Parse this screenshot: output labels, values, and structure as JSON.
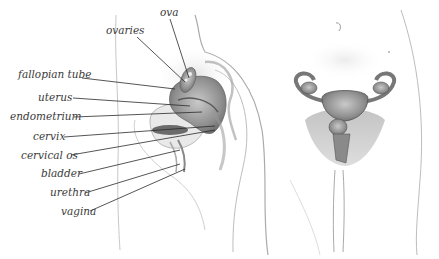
{
  "diagram": {
    "views": [
      "side-section",
      "front"
    ],
    "labels": [
      {
        "id": "ova",
        "text": "ova",
        "x": 160,
        "y": 7,
        "line": [
          [
            170,
            19
          ],
          [
            189,
            78
          ]
        ]
      },
      {
        "id": "ovaries",
        "text": "ovaries",
        "x": 106,
        "y": 25,
        "line": [
          [
            137,
            37
          ],
          [
            185,
            82
          ]
        ]
      },
      {
        "id": "fallopian-tube",
        "text": "fallopian tube",
        "x": 18,
        "y": 69,
        "line": [
          [
            82,
            78
          ],
          [
            175,
            89
          ]
        ]
      },
      {
        "id": "uterus",
        "text": "uterus",
        "x": 38,
        "y": 92,
        "line": [
          [
            73,
            98
          ],
          [
            190,
            106
          ]
        ]
      },
      {
        "id": "endometrium",
        "text": "endometrium",
        "x": 10,
        "y": 111,
        "line": [
          [
            74,
            117
          ],
          [
            202,
            112
          ]
        ]
      },
      {
        "id": "cervix",
        "text": "cervix",
        "x": 33,
        "y": 131,
        "line": [
          [
            64,
            137
          ],
          [
            215,
            126
          ]
        ]
      },
      {
        "id": "cervical-os",
        "text": "cervical os",
        "x": 21,
        "y": 150,
        "line": [
          [
            71,
            155
          ],
          [
            215,
            130
          ]
        ]
      },
      {
        "id": "bladder",
        "text": "bladder",
        "x": 41,
        "y": 168,
        "line": [
          [
            79,
            174
          ],
          [
            180,
            150
          ]
        ]
      },
      {
        "id": "urethra",
        "text": "urethra",
        "x": 50,
        "y": 187,
        "line": [
          [
            85,
            193
          ],
          [
            180,
            164
          ]
        ]
      },
      {
        "id": "vagina",
        "text": "vagina",
        "x": 61,
        "y": 206,
        "line": [
          [
            90,
            211
          ],
          [
            185,
            169
          ]
        ]
      }
    ],
    "colors": {
      "label_text": "#3a3a3a",
      "leader_line": "#2a2a2a",
      "organ_fill": "#9a9a9a",
      "organ_dark": "#555555",
      "body_outline": "#bdbdbd",
      "skin_shade": "#e6e6e6"
    }
  }
}
